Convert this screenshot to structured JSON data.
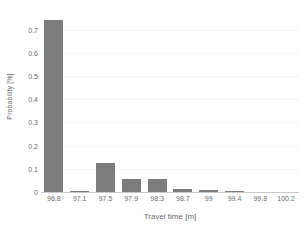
{
  "chart_data": {
    "type": "bar",
    "title": "",
    "xlabel": "Travel time [m]",
    "ylabel": "Probability [%]",
    "categories": [
      "96.8",
      "97.1",
      "97.5",
      "97.9",
      "98.3",
      "98.7",
      "99",
      "99.4",
      "99.8",
      "100.2"
    ],
    "values": [
      0.74,
      0.005,
      0.125,
      0.058,
      0.058,
      0.012,
      0.01,
      0.004,
      0.0,
      0.0
    ],
    "ylim": [
      0,
      0.78
    ],
    "y_ticks": [
      0,
      0.1,
      0.2,
      0.3,
      0.4,
      0.5,
      0.6,
      0.7
    ],
    "y_tick_labels": [
      "0",
      "0.1",
      "0.2",
      "0.3",
      "0.4",
      "0.5",
      "0.6",
      "0.7"
    ],
    "grid": true,
    "legend": false,
    "series": [
      {
        "name": "Probability",
        "color": "#7c7c7c",
        "values": [
          0.74,
          0.005,
          0.125,
          0.058,
          0.058,
          0.012,
          0.01,
          0.004,
          0.0,
          0.0
        ]
      }
    ]
  },
  "colors": {
    "bar": "#7c7c7c",
    "axis": "#c8c8c8",
    "grid": "#f4f4f4",
    "text": "#6b6b6b",
    "background": "#ffffff"
  }
}
